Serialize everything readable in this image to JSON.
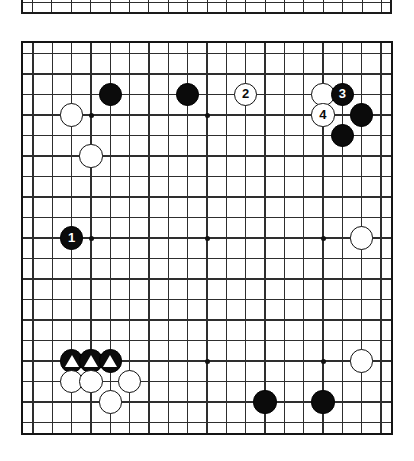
{
  "diagram": {
    "kind": "go-board-diagram",
    "board_size": 19,
    "title": "",
    "caption": "",
    "colors": {
      "black_stone": "#0b0b0b",
      "white_stone": "#ffffff",
      "grid_line": "#2e2e2e",
      "border": "#141414",
      "background": "#ffffff",
      "black_label_text": "#ffffff",
      "white_label_text": "#0b0b0b"
    }
  },
  "top_partial_board": {
    "present": true,
    "description": "bottom edge of the preceding diagram, cropped",
    "columns": 19
  },
  "board": {
    "size": 19,
    "star_points": [
      {
        "col": 3,
        "row": 3
      },
      {
        "col": 9,
        "row": 3
      },
      {
        "col": 15,
        "row": 3
      },
      {
        "col": 3,
        "row": 9
      },
      {
        "col": 9,
        "row": 9
      },
      {
        "col": 15,
        "row": 9
      },
      {
        "col": 3,
        "row": 15
      },
      {
        "col": 9,
        "row": 15
      },
      {
        "col": 15,
        "row": 15
      }
    ],
    "stones": [
      {
        "id": "b-c4r2",
        "color": "black",
        "col": 4,
        "row": 2,
        "label": "",
        "mark": ""
      },
      {
        "id": "b-c8r2",
        "color": "black",
        "col": 8,
        "row": 2,
        "label": "",
        "mark": ""
      },
      {
        "id": "w-move2",
        "color": "white",
        "col": 11,
        "row": 2,
        "label": "2",
        "mark": ""
      },
      {
        "id": "w-c15r2",
        "color": "white",
        "col": 15,
        "row": 2,
        "label": "",
        "mark": ""
      },
      {
        "id": "b-move3",
        "color": "black",
        "col": 16,
        "row": 2,
        "label": "3",
        "mark": ""
      },
      {
        "id": "w-c2r3",
        "color": "white",
        "col": 2,
        "row": 3,
        "label": "",
        "mark": ""
      },
      {
        "id": "w-move4",
        "color": "white",
        "col": 15,
        "row": 3,
        "label": "4",
        "mark": ""
      },
      {
        "id": "b-c17r3",
        "color": "black",
        "col": 17,
        "row": 3,
        "label": "",
        "mark": ""
      },
      {
        "id": "b-c16r4",
        "color": "black",
        "col": 16,
        "row": 4,
        "label": "",
        "mark": ""
      },
      {
        "id": "w-c3r5",
        "color": "white",
        "col": 3,
        "row": 5,
        "label": "",
        "mark": ""
      },
      {
        "id": "b-move1",
        "color": "black",
        "col": 2,
        "row": 9,
        "label": "1",
        "mark": ""
      },
      {
        "id": "w-c17r9",
        "color": "white",
        "col": 17,
        "row": 9,
        "label": "",
        "mark": ""
      },
      {
        "id": "b-c2r15",
        "color": "black",
        "col": 2,
        "row": 15,
        "label": "",
        "mark": "triangle"
      },
      {
        "id": "b-c3r15",
        "color": "black",
        "col": 3,
        "row": 15,
        "label": "",
        "mark": "triangle"
      },
      {
        "id": "b-c4r15",
        "color": "black",
        "col": 4,
        "row": 15,
        "label": "",
        "mark": "triangle"
      },
      {
        "id": "w-c17r15",
        "color": "white",
        "col": 17,
        "row": 15,
        "label": "",
        "mark": ""
      },
      {
        "id": "w-c2r16",
        "color": "white",
        "col": 2,
        "row": 16,
        "label": "",
        "mark": ""
      },
      {
        "id": "w-c3r16",
        "color": "white",
        "col": 3,
        "row": 16,
        "label": "",
        "mark": ""
      },
      {
        "id": "w-c5r16",
        "color": "white",
        "col": 5,
        "row": 16,
        "label": "",
        "mark": ""
      },
      {
        "id": "w-c4r17",
        "color": "white",
        "col": 4,
        "row": 17,
        "label": "",
        "mark": ""
      },
      {
        "id": "b-c12r17",
        "color": "black",
        "col": 12,
        "row": 17,
        "label": "",
        "mark": ""
      },
      {
        "id": "b-c15r17",
        "color": "black",
        "col": 15,
        "row": 17,
        "label": "",
        "mark": ""
      }
    ],
    "move_sequence": [
      {
        "number": "1",
        "color": "black"
      },
      {
        "number": "2",
        "color": "white"
      },
      {
        "number": "3",
        "color": "black"
      },
      {
        "number": "4",
        "color": "white"
      }
    ]
  }
}
